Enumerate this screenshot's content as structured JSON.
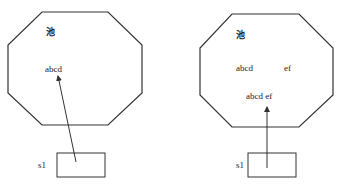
{
  "diagrams": [
    {
      "pool_label": "池",
      "strings": [
        "abcd"
      ],
      "variable": "s1"
    },
    {
      "pool_label": "池",
      "strings": [
        "abcd",
        "ef",
        "abcd ef"
      ],
      "variable": "s1"
    }
  ],
  "colors": {
    "line": "#333333",
    "background": "#ffffff"
  }
}
